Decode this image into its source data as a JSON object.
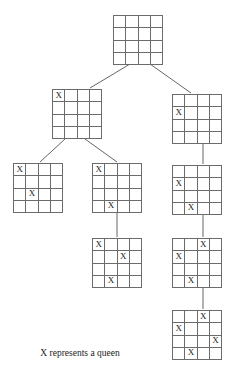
{
  "figure": {
    "caption": "X represents a queen",
    "queen_symbol": "X",
    "board_size": 4,
    "line_color": "#6b6b6b",
    "edge_color": "#555555",
    "text_color": "#1a1a1a",
    "background_color": "#ffffff"
  },
  "chart_data": {
    "type": "diagram",
    "caption": "X represents a queen",
    "nodes": [
      {
        "id": "root",
        "level": 0,
        "x": 113,
        "y": 15,
        "size": 50,
        "queens": [],
        "label": "empty board"
      },
      {
        "id": "n1L",
        "level": 1,
        "x": 52,
        "y": 89,
        "size": 50,
        "queens": [
          {
            "row": 1,
            "col": 1
          }
        ],
        "label": "queen at row 1 column 1"
      },
      {
        "id": "n1R",
        "level": 1,
        "x": 172,
        "y": 94,
        "size": 50,
        "queens": [
          {
            "row": 2,
            "col": 1
          }
        ],
        "label": "queen at row 2 column 1"
      },
      {
        "id": "n2L",
        "level": 2,
        "x": 13,
        "y": 163,
        "size": 50,
        "queens": [
          {
            "row": 1,
            "col": 1
          },
          {
            "row": 3,
            "col": 2
          }
        ],
        "label": "queens at row 1 column 1 and row 3 column 2"
      },
      {
        "id": "n2M",
        "level": 2,
        "x": 92,
        "y": 163,
        "size": 50,
        "queens": [
          {
            "row": 1,
            "col": 1
          },
          {
            "row": 4,
            "col": 2
          }
        ],
        "label": "queens at row 1 column 1 and row 4 column 2"
      },
      {
        "id": "n2R",
        "level": 2,
        "x": 172,
        "y": 165,
        "size": 50,
        "queens": [
          {
            "row": 2,
            "col": 1
          },
          {
            "row": 4,
            "col": 2
          }
        ],
        "label": "queens at row 2 column 1 and row 4 column 2"
      },
      {
        "id": "n3M",
        "level": 3,
        "x": 92,
        "y": 238,
        "size": 50,
        "queens": [
          {
            "row": 1,
            "col": 1
          },
          {
            "row": 2,
            "col": 3
          },
          {
            "row": 4,
            "col": 2
          }
        ],
        "label": "queens at row 1 column 1, row 2 column 3, row 4 column 2"
      },
      {
        "id": "n3R",
        "level": 3,
        "x": 172,
        "y": 238,
        "size": 50,
        "queens": [
          {
            "row": 1,
            "col": 3
          },
          {
            "row": 2,
            "col": 1
          },
          {
            "row": 4,
            "col": 2
          }
        ],
        "label": "queens at row 1 column 3, row 2 column 1, row 4 column 2"
      },
      {
        "id": "n4R",
        "level": 4,
        "x": 172,
        "y": 310,
        "size": 50,
        "queens": [
          {
            "row": 1,
            "col": 3
          },
          {
            "row": 2,
            "col": 1
          },
          {
            "row": 3,
            "col": 4
          },
          {
            "row": 4,
            "col": 2
          }
        ],
        "label": "solution: queens at row 1 column 3, row 2 column 1, row 3 column 4, row 4 column 2"
      }
    ],
    "edges": [
      {
        "from": "root",
        "to": "n1L",
        "x1": 130,
        "y1": 64,
        "x2": 90,
        "y2": 88
      },
      {
        "from": "root",
        "to": "n1R",
        "x1": 150,
        "y1": 64,
        "x2": 191,
        "y2": 93
      },
      {
        "from": "n1L",
        "to": "n2L",
        "x1": 65,
        "y1": 139,
        "x2": 40,
        "y2": 162
      },
      {
        "from": "n1L",
        "to": "n2M",
        "x1": 85,
        "y1": 139,
        "x2": 117,
        "y2": 162
      },
      {
        "from": "n1R",
        "to": "n2R",
        "x1": 203,
        "y1": 144,
        "x2": 203,
        "y2": 164
      },
      {
        "from": "n2M",
        "to": "n3M",
        "x1": 117,
        "y1": 213,
        "x2": 117,
        "y2": 237
      },
      {
        "from": "n2R",
        "to": "n3R",
        "x1": 203,
        "y1": 215,
        "x2": 203,
        "y2": 237
      },
      {
        "from": "n3R",
        "to": "n4R",
        "x1": 203,
        "y1": 288,
        "x2": 203,
        "y2": 309
      }
    ]
  }
}
